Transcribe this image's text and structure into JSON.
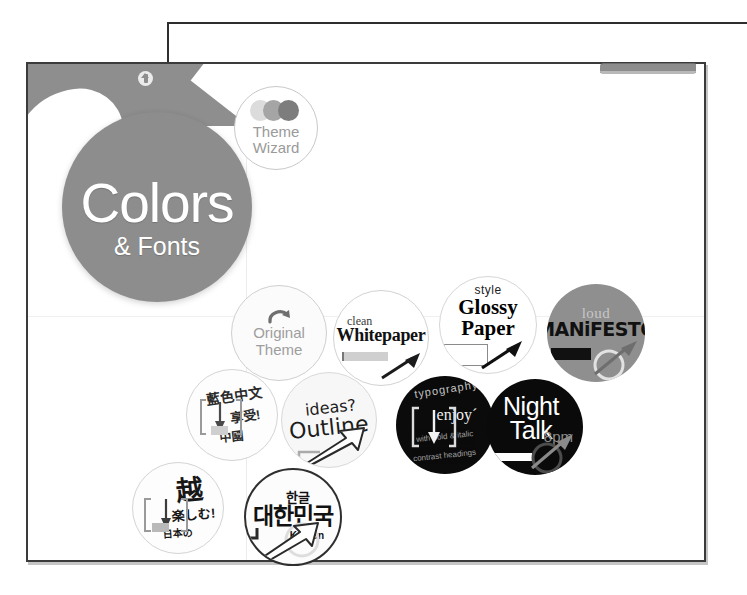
{
  "callout": {
    "name": "leader-line-to-colors-bubble",
    "arrow_target": "colors-and-fonts-bubble"
  },
  "slide": {
    "banner": {
      "name": "header-banner",
      "badge_icon": "upload-arrow-icon"
    },
    "frame_tab_label": ""
  },
  "bubbles": {
    "main": {
      "title": "Colors",
      "subtitle": "& Fonts",
      "color": "#8d8d8d",
      "text_color": "#ffffff"
    },
    "wizard": {
      "label_line1": "Theme",
      "label_line2": "Wizard",
      "dot_colors": [
        "#dcdcdc",
        "#a5a5a5",
        "#7d7d7d"
      ],
      "text_color": "#9a9a9a"
    },
    "original": {
      "label_line1": "Original",
      "label_line2": "Theme",
      "icon": "undo-arrow-icon",
      "text_color": "#9e9e9e"
    },
    "whitepaper": {
      "small": "clean",
      "big": "Whitepaper",
      "swatch_color": "#cfcfcf",
      "background": "#ffffff"
    },
    "glossy": {
      "small": "style",
      "big_line1": "Glossy",
      "big_line2": "Paper",
      "background": "#ffffff"
    },
    "manifesto": {
      "small": "loud",
      "big": "MANiFESTO",
      "background": "#8f8f8f",
      "swatch_color": "#111111"
    },
    "chinese": {
      "line1": "藍色中文",
      "line2": "享受!",
      "line3": "中國",
      "background": "#fdfdfd"
    },
    "outline": {
      "line1": "ideas?",
      "line2": "Outline",
      "icon": "outlined-arrow-icon",
      "background": "#f7f7f7"
    },
    "typography": {
      "arc": "typography",
      "mid": "enjoy´",
      "sub_line1": "with bold & italic",
      "sub_line2": "contrast headings",
      "background": "#0b0b0b"
    },
    "night": {
      "big_line1": "Night",
      "big_line2": "Talk",
      "time": "8pm",
      "background": "#0a0a0a",
      "text_color": "#ffffff",
      "time_color": "#8d8d8d"
    },
    "japanese": {
      "big": "越",
      "mid": "楽しむ!",
      "sub": "日本の",
      "background": "#fdfdfd"
    },
    "korean": {
      "small": "한글",
      "big": "대한민국",
      "english": "Korean",
      "background": "#fcfcfc",
      "border_color": "#2f2f2f"
    }
  }
}
